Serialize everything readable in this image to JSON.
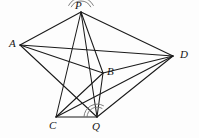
{
  "figure": {
    "background_color": "#fdfdfd",
    "stroke_color": "#1a1a1a",
    "arc_color": "#6f6f6f",
    "width": 199,
    "height": 138,
    "points": [
      {
        "id": "P",
        "label": "P",
        "x": 81,
        "y": 12,
        "label_x": 75,
        "label_y": 0
      },
      {
        "id": "A",
        "label": "A",
        "x": 20,
        "y": 45,
        "label_x": 9,
        "label_y": 38
      },
      {
        "id": "D",
        "label": "D",
        "x": 173,
        "y": 56,
        "label_x": 180,
        "label_y": 49
      },
      {
        "id": "B",
        "label": "B",
        "x": 103,
        "y": 73,
        "label_x": 107,
        "label_y": 66
      },
      {
        "id": "C",
        "label": "C",
        "x": 56,
        "y": 117,
        "label_x": 49,
        "label_y": 120
      },
      {
        "id": "Q",
        "label": "Q",
        "x": 97,
        "y": 117,
        "label_x": 92,
        "label_y": 121
      }
    ],
    "segments": [
      {
        "name": "segment-A-P",
        "from": "A",
        "to": "P"
      },
      {
        "name": "segment-P-D",
        "from": "P",
        "to": "D"
      },
      {
        "name": "segment-A-D",
        "from": "A",
        "to": "D"
      },
      {
        "name": "segment-A-B",
        "from": "A",
        "to": "B"
      },
      {
        "name": "segment-A-Q",
        "from": "A",
        "to": "Q"
      },
      {
        "name": "segment-P-C",
        "from": "P",
        "to": "C"
      },
      {
        "name": "segment-P-B",
        "from": "P",
        "to": "B"
      },
      {
        "name": "segment-P-Q",
        "from": "P",
        "to": "Q"
      },
      {
        "name": "segment-B-C",
        "from": "B",
        "to": "C"
      },
      {
        "name": "segment-B-Q",
        "from": "B",
        "to": "Q"
      },
      {
        "name": "segment-B-D",
        "from": "B",
        "to": "D"
      },
      {
        "name": "segment-C-D",
        "from": "C",
        "to": "D"
      },
      {
        "name": "segment-C-Q",
        "from": "C",
        "to": "Q"
      },
      {
        "name": "segment-Q-D",
        "from": "Q",
        "to": "D"
      }
    ],
    "angle_marks": [
      {
        "name": "angle-arc-at-P",
        "vertex": "P",
        "radii": [
          11,
          14
        ],
        "start_deg": 208,
        "end_deg": 332
      },
      {
        "name": "angle-arc-at-Q",
        "vertex": "Q",
        "radii": [
          10,
          13
        ],
        "start_deg": 182,
        "end_deg": 300
      }
    ]
  }
}
